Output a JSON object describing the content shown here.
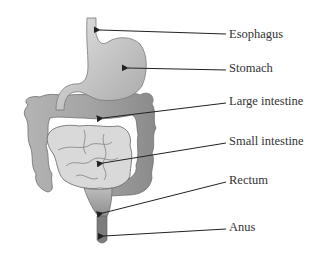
{
  "labels": [
    {
      "id": "esophagus",
      "text": "Esophagus",
      "x": 229,
      "y": 26,
      "target": [
        100,
        32
      ]
    },
    {
      "id": "stomach",
      "text": "Stomach",
      "x": 229,
      "y": 62,
      "target": [
        128,
        68
      ]
    },
    {
      "id": "large_intestine",
      "text": "Large intestine",
      "x": 229,
      "y": 94,
      "target": [
        102,
        118
      ]
    },
    {
      "id": "small_intestine",
      "text": "Small intestine",
      "x": 229,
      "y": 133,
      "target": [
        103,
        163
      ]
    },
    {
      "id": "rectum",
      "text": "Rectum",
      "x": 229,
      "y": 172,
      "target": [
        103,
        212
      ]
    },
    {
      "id": "anus",
      "text": "Anus",
      "x": 229,
      "y": 221,
      "target": [
        103,
        236
      ]
    }
  ],
  "colors": {
    "text": "#333333",
    "arrow": "#222222",
    "esophagus": "#cfcfcf",
    "stomach": "#bdbdbd",
    "large_intestine": "#9e9e9e",
    "small_intestine": "#d8d8d8",
    "rectum": "#a8a8a8",
    "anus": "#7a7a7a"
  }
}
